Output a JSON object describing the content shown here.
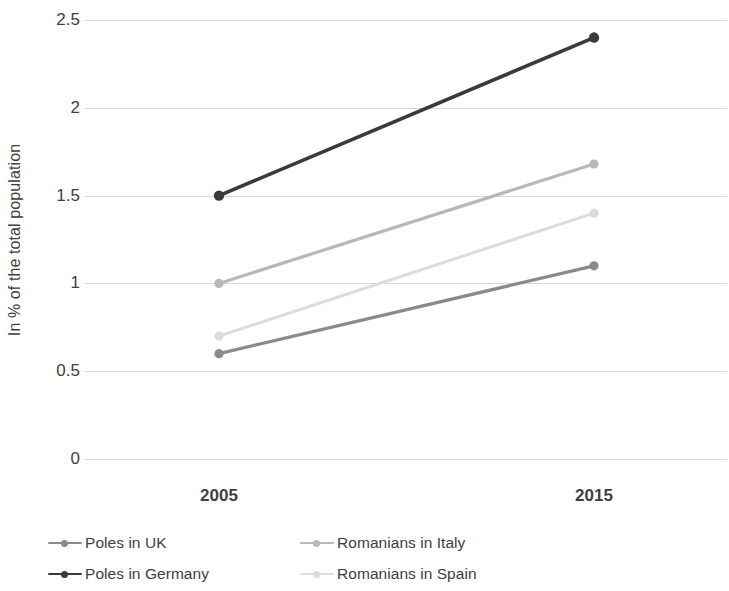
{
  "chart_data": {
    "type": "line",
    "title": "",
    "subtitle": "",
    "xlabel": "",
    "ylabel": "In % of the total population",
    "categories": [
      "2005",
      "2015"
    ],
    "x": [
      2005,
      2015
    ],
    "ylim": [
      0,
      2.5
    ],
    "y_ticks": [
      "0",
      "0.5",
      "1",
      "1.5",
      "2",
      "2.5"
    ],
    "y_tick_values": [
      0,
      0.5,
      1,
      1.5,
      2,
      2.5
    ],
    "grid": "horizontal",
    "legend_position": "bottom",
    "legend_columns": 2,
    "series": [
      {
        "name": "Poles in UK",
        "values": [
          0.6,
          1.1
        ],
        "color": "#8a8a8a",
        "marker": "circle"
      },
      {
        "name": "Poles in Germany",
        "values": [
          1.5,
          2.4
        ],
        "color": "#3a3a3a",
        "marker": "circle"
      },
      {
        "name": "Romanians in Italy",
        "values": [
          1.0,
          1.68
        ],
        "color": "#b8b8b8",
        "marker": "circle"
      },
      {
        "name": "Romanians in Spain",
        "values": [
          0.7,
          1.4
        ],
        "color": "#dcdcdc",
        "marker": "circle"
      }
    ]
  },
  "legend_order": [
    {
      "series_index": 0,
      "name": "Poles in UK",
      "color": "#8a8a8a"
    },
    {
      "series_index": 2,
      "name": "Romanians in Italy",
      "color": "#b8b8b8"
    },
    {
      "series_index": 1,
      "name": "Poles in Germany",
      "color": "#3a3a3a"
    },
    {
      "series_index": 3,
      "name": "Romanians in Spain",
      "color": "#dcdcdc"
    }
  ],
  "style": {
    "background": "#ffffff",
    "gridline_color": "#d9d9d9",
    "text_color": "#3f3f3f",
    "legend_text_color": "#404040"
  }
}
